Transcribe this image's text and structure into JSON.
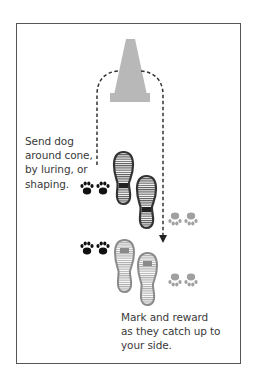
{
  "diagram": {
    "type": "dog-training-illustration",
    "colors": {
      "frame": "#555555",
      "cone": "#b8b8b8",
      "path": "#333333",
      "dark_paws": "#111111",
      "light_paws": "#a0a0a0",
      "dark_shoes": "#333333",
      "light_shoes": "#8a8a8a",
      "text": "#3a3a3a"
    },
    "elements": {
      "cone": {
        "icon": "traffic-cone-icon"
      },
      "path": {
        "style": "dashed",
        "direction": "around cone, ending with arrow downward"
      },
      "shoes_dark": {
        "icon": "shoe-print-icon",
        "count": 2
      },
      "shoes_light": {
        "icon": "shoe-print-icon",
        "count": 2
      },
      "paws_dark": {
        "icon": "paw-print-icon",
        "count": 2
      },
      "paws_light": {
        "icon": "paw-print-icon",
        "count": 2
      }
    },
    "captions": {
      "step1": "Send dog\naround cone,\nby luring, or\nshaping.",
      "step2": "Mark and reward\nas they catch up to\nyour side."
    }
  }
}
